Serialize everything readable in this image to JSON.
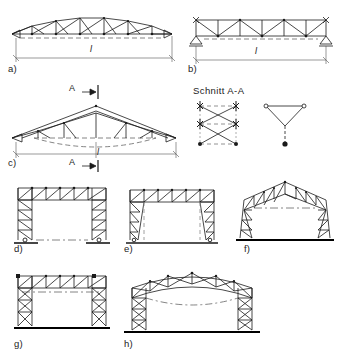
{
  "diagram": {
    "section_title": "Schnitt  A-A",
    "span_symbol": "l",
    "section_marker": "A",
    "colors": {
      "line": "#1a1a1a",
      "background": "#ffffff",
      "dashed": "#555555",
      "ground": "#000000"
    },
    "figures": [
      {
        "id": "a",
        "label": "a)",
        "caption": "Dreieckiger Untergurt-Fachwerkbinder mit Spannweite l",
        "type": "truss-beam",
        "top_chord": "cambered",
        "bottom_chord": "straight",
        "web": "warren-with-verticals",
        "supports": [
          "pinned",
          "roller"
        ],
        "dimension_label": "l",
        "panels": 8
      },
      {
        "id": "b",
        "label": "b)",
        "caption": "Parallelgurt-Fachwerkbinder mit Spannweite l",
        "type": "truss-beam",
        "top_chord": "straight",
        "bottom_chord": "straight",
        "web": "warren-with-verticals",
        "supports": [
          "pinned",
          "pinned"
        ],
        "dimension_label": "l",
        "panels": 6
      },
      {
        "id": "c",
        "label": "c)",
        "caption": "Satteldach-Fachwerkbinder mit Schnitt A-A",
        "type": "truss-beam",
        "top_chord": "pitched",
        "bottom_chord": "polygonal-dashed",
        "web": "diagonal",
        "supports": [
          "pinned",
          "roller"
        ],
        "dimension_label": "l",
        "section_marker": "A",
        "panels": 10
      },
      {
        "id": "d",
        "label": "d)",
        "caption": "Rechteckrahmen mit Fachwerkstielen und Fachwerkriegel",
        "type": "portal-frame",
        "roof": "flat",
        "columns": "lattice-parallel",
        "bases": "pinned"
      },
      {
        "id": "e",
        "label": "e)",
        "caption": "Rahmen mit sich verjuengenden Fachwerkstielen",
        "type": "portal-frame",
        "roof": "flat",
        "columns": "lattice-tapered",
        "bases": "pinned"
      },
      {
        "id": "f",
        "label": "f)",
        "caption": "Satteldachrahmen mit geneigten Fachwerkstielen",
        "type": "portal-frame",
        "roof": "pitched",
        "columns": "lattice-tapered-inclined",
        "bases": "fixed"
      },
      {
        "id": "g",
        "label": "g)",
        "caption": "Rechteckrahmen mit kreuzweise ausgefachten Stielen",
        "type": "portal-frame",
        "roof": "flat",
        "columns": "lattice-x-braced",
        "bases": "fixed"
      },
      {
        "id": "h",
        "label": "h)",
        "caption": "Rahmen mit bogenfoermigem Fachwerkriegel",
        "type": "portal-frame",
        "roof": "arched",
        "columns": "lattice-x-braced",
        "bases": "fixed"
      }
    ],
    "sections": [
      {
        "id": "section-rect",
        "name": "Rechteckquerschnitt mit Kreuzverband",
        "shape": "rectangular",
        "bracing": "cross",
        "node_rows": 3
      },
      {
        "id": "section-tri",
        "name": "Dreiecksquerschnitt mit Untergurt",
        "shape": "triangular",
        "bracing": "inverted-triangle",
        "node_rows": 2
      }
    ]
  }
}
